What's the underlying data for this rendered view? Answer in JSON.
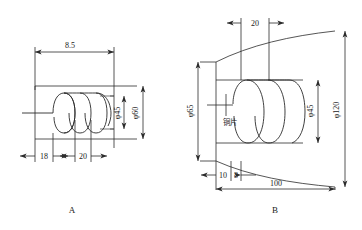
{
  "figure": {
    "title": "",
    "panels": [
      {
        "id": "A",
        "caption": "A",
        "description": "cylindrical-induction-coil-with-dimensions",
        "dimensions": [
          {
            "name": "overall-length",
            "label": "8.5",
            "value": "8.5",
            "orientation": "horizontal",
            "position": "top"
          },
          {
            "name": "inner-diameter",
            "label": "φ45",
            "value": "45",
            "orientation": "vertical",
            "position": "inner-right"
          },
          {
            "name": "outer-diameter",
            "label": "φ60",
            "value": "60",
            "orientation": "vertical",
            "position": "outer-right"
          },
          {
            "name": "start-offset",
            "label": "18",
            "value": "18",
            "orientation": "horizontal",
            "position": "bottom-left"
          },
          {
            "name": "pitch",
            "label": "20",
            "value": "20",
            "orientation": "horizontal",
            "position": "bottom-middle"
          }
        ],
        "coil_turns": 4
      },
      {
        "id": "B",
        "caption": "B",
        "description": "barrel-shaped-induction-coil-with-copper-sheet",
        "dimensions": [
          {
            "name": "pitch",
            "label": "20",
            "value": "20",
            "orientation": "horizontal",
            "position": "top"
          },
          {
            "name": "left-diameter",
            "label": "φ65",
            "value": "65",
            "orientation": "vertical",
            "position": "left"
          },
          {
            "name": "coil-inner-diameter",
            "label": "φ45",
            "value": "45",
            "orientation": "vertical",
            "position": "inner-right"
          },
          {
            "name": "outer-diameter",
            "label": "φ120",
            "value": "120",
            "orientation": "vertical",
            "position": "outer-right"
          },
          {
            "name": "edge-offset",
            "label": "10",
            "value": "10",
            "orientation": "horizontal",
            "position": "bottom-left"
          },
          {
            "name": "sheet-thickness",
            "label": "8",
            "value": "8",
            "orientation": "horizontal",
            "position": "bottom-left-2"
          },
          {
            "name": "overall-length",
            "label": "100",
            "value": "100",
            "orientation": "horizontal",
            "position": "bottom"
          }
        ],
        "annotations": [
          {
            "name": "copper-sheet-label",
            "label": "铜片"
          }
        ],
        "coil_turns": 3
      }
    ],
    "colors": {
      "line": "#2b2b2b",
      "text": "#1a1a1a",
      "background": "#ffffff"
    }
  }
}
